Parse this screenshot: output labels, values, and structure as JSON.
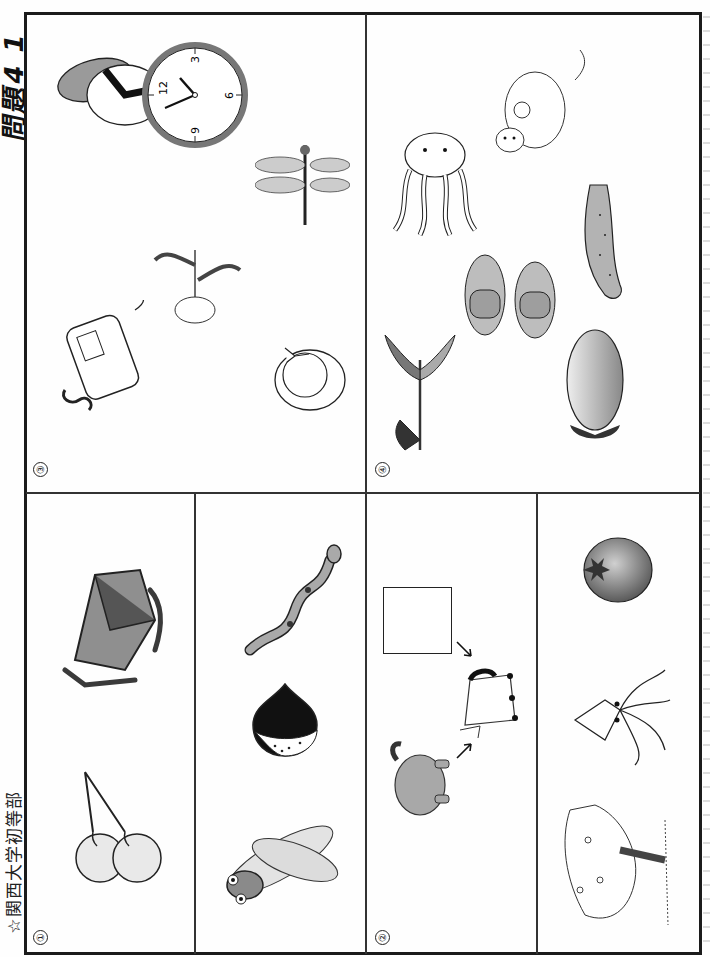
{
  "document": {
    "school": "☆関西大学初等部",
    "problem_label": "問題4 1",
    "orientation": "rotated-90-ccw"
  },
  "panels": [
    {
      "number": "①",
      "rows": [
        {
          "items": [
            "cherries",
            "sled"
          ]
        },
        {
          "items": [
            "cicada",
            "chestnut",
            "snake"
          ]
        }
      ]
    },
    {
      "number": "②",
      "rows": [
        {
          "items": [
            "elephant",
            "arrow",
            "horse",
            "arrow",
            "blank-answer-box"
          ]
        },
        {
          "items": [
            "cherry-blossom-tree",
            "squid",
            "tomato"
          ]
        }
      ]
    },
    {
      "number": "③",
      "items": [
        "telephone",
        "chrysanthemum",
        "rice-ball",
        "hat",
        "dragonfly",
        "clock"
      ],
      "clock": {
        "numerals": [
          "12",
          "3",
          "6",
          "9"
        ]
      }
    },
    {
      "number": "④",
      "items": [
        "tulip",
        "eggplant",
        "slippers",
        "octopus",
        "cucumber",
        "kangaroo"
      ]
    }
  ],
  "colors": {
    "frame": "#1b1b1b",
    "gray_fill": "#9a9a9a",
    "dark_fill": "#3c3c3c",
    "light_fill": "#d9d9d9"
  }
}
